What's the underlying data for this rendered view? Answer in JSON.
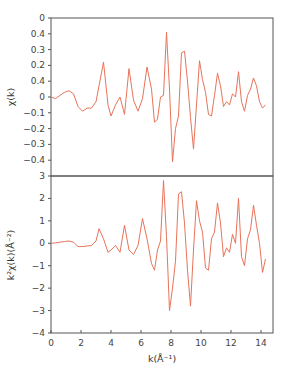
{
  "chart_data": [
    {
      "type": "line",
      "panel": "top",
      "title": "",
      "xlabel": "",
      "ylabel": "χ(k)",
      "xlim": [
        0,
        14.8
      ],
      "ylim": [
        -0.5,
        0.5
      ],
      "yticks": [
        0.5,
        0.4,
        0.3,
        0.2,
        0.1,
        0,
        -0.1,
        -0.2,
        -0.3,
        -0.4
      ],
      "ytick_labels": [
        "0",
        "0.4",
        "0.3",
        "0.2",
        "0.4",
        "0",
        "−0.1",
        "−0.2",
        "−0.3",
        "−0.4"
      ],
      "grid": false,
      "line_color": "#e8735a",
      "series": [
        {
          "name": "chi(k)",
          "x": [
            0,
            0.3,
            0.6,
            0.9,
            1.2,
            1.5,
            1.8,
            2.1,
            2.4,
            2.7,
            3.0,
            3.2,
            3.5,
            3.8,
            4.0,
            4.3,
            4.6,
            4.9,
            5.2,
            5.5,
            5.8,
            6.1,
            6.4,
            6.7,
            6.9,
            7.1,
            7.3,
            7.5,
            7.7,
            7.9,
            8.1,
            8.3,
            8.5,
            8.7,
            8.9,
            9.1,
            9.3,
            9.5,
            9.7,
            9.9,
            10.1,
            10.3,
            10.5,
            10.7,
            10.9,
            11.1,
            11.3,
            11.5,
            11.7,
            11.9,
            12.1,
            12.3,
            12.5,
            12.7,
            12.9,
            13.1,
            13.3,
            13.5,
            13.7,
            13.9,
            14.1,
            14.3
          ],
          "values": [
            0,
            -0.01,
            0.01,
            0.03,
            0.04,
            0.02,
            -0.06,
            -0.09,
            -0.07,
            -0.07,
            -0.03,
            0.07,
            0.22,
            -0.05,
            -0.12,
            -0.05,
            0.0,
            -0.11,
            0.18,
            -0.02,
            -0.09,
            -0.01,
            0.19,
            0.05,
            -0.16,
            -0.14,
            0.0,
            0.01,
            0.41,
            0.05,
            -0.41,
            -0.2,
            -0.12,
            0.28,
            0.29,
            0.1,
            -0.13,
            -0.33,
            -0.05,
            0.23,
            0.11,
            0.03,
            -0.11,
            -0.12,
            0.01,
            0.15,
            0.07,
            -0.06,
            -0.03,
            -0.05,
            0.02,
            0.0,
            0.16,
            -0.03,
            -0.09,
            0.01,
            0.05,
            0.12,
            0.07,
            -0.03,
            -0.07,
            -0.05
          ]
        }
      ]
    },
    {
      "type": "line",
      "panel": "bottom",
      "title": "",
      "xlabel": "k(Å⁻¹)",
      "ylabel": "k²χ(k)(Å⁻²)",
      "xlim": [
        0,
        14.8
      ],
      "ylim": [
        -4,
        3
      ],
      "xticks": [
        0,
        2,
        4,
        6,
        8,
        10,
        12,
        14
      ],
      "yticks": [
        3,
        2,
        1,
        0,
        -1,
        -2,
        -3,
        -4
      ],
      "ytick_labels": [
        "3",
        "2",
        "1",
        "0",
        "−1",
        "−2",
        "−3",
        "−4"
      ],
      "grid": false,
      "line_color": "#e8735a",
      "series": [
        {
          "name": "k2chi(k)",
          "x": [
            0,
            0.3,
            0.6,
            0.9,
            1.2,
            1.5,
            1.8,
            2.1,
            2.4,
            2.7,
            3.0,
            3.2,
            3.5,
            3.8,
            4.0,
            4.3,
            4.6,
            4.9,
            5.2,
            5.5,
            5.8,
            6.1,
            6.4,
            6.7,
            6.9,
            7.1,
            7.3,
            7.5,
            7.7,
            7.9,
            8.1,
            8.3,
            8.5,
            8.7,
            8.9,
            9.1,
            9.3,
            9.5,
            9.7,
            9.9,
            10.1,
            10.3,
            10.5,
            10.7,
            10.9,
            11.1,
            11.3,
            11.5,
            11.7,
            11.9,
            12.1,
            12.3,
            12.5,
            12.7,
            12.9,
            13.1,
            13.3,
            13.5,
            13.7,
            13.9,
            14.1,
            14.3
          ],
          "values": [
            0.0,
            0.02,
            0.05,
            0.08,
            0.1,
            0.05,
            -0.15,
            -0.15,
            -0.12,
            -0.1,
            0.1,
            0.65,
            0.2,
            -0.4,
            -0.3,
            -0.1,
            -0.4,
            0.8,
            -0.3,
            -0.5,
            -0.1,
            1.1,
            0.2,
            -0.9,
            -1.2,
            -0.3,
            0.1,
            2.8,
            0.3,
            -3.0,
            -2.0,
            -0.8,
            2.2,
            2.3,
            0.9,
            -1.2,
            -2.8,
            -0.3,
            1.9,
            1.0,
            0.5,
            -1.1,
            -1.2,
            0.2,
            0.5,
            1.8,
            0.9,
            -0.6,
            -0.2,
            -0.4,
            0.4,
            0.0,
            2.0,
            -0.6,
            -1.0,
            0.2,
            0.6,
            1.7,
            0.8,
            0.0,
            -1.3,
            -0.7
          ]
        }
      ]
    }
  ],
  "labels": {
    "top_ylabel": "χ(k)",
    "bottom_ylabel": "k²χ(k)(Å⁻²)",
    "xlabel": "k(Å⁻¹)"
  }
}
